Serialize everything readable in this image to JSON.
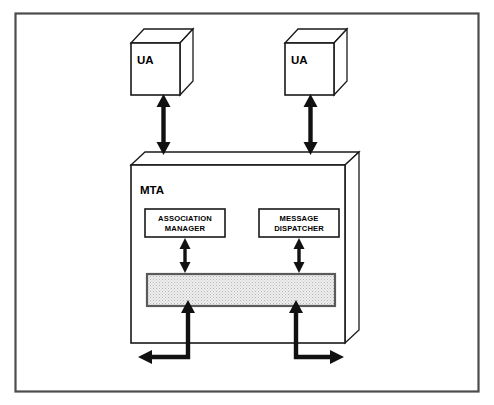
{
  "figure": {
    "type": "block-diagram",
    "title": "",
    "background_color": "#ffffff",
    "frame": {
      "name": "outer-border",
      "color": "#4c4c4c"
    }
  },
  "nodes": {
    "ua_left": {
      "label": "UA",
      "shape": "cube",
      "fill": "#ffffff",
      "stroke": "#1a1a1a"
    },
    "ua_right": {
      "label": "UA",
      "shape": "cube",
      "fill": "#ffffff",
      "stroke": "#1a1a1a"
    },
    "mta": {
      "label": "MTA",
      "shape": "cube",
      "fill": "#ffffff",
      "stroke": "#1a1a1a"
    },
    "association_manager": {
      "label_line1": "ASSOCIATION",
      "label_line2": "MANAGER",
      "shape": "rectangle",
      "fill": "#ffffff"
    },
    "message_dispatcher": {
      "label_line1": "MESSAGE",
      "label_line2": "DISPATCHER",
      "shape": "rectangle",
      "fill": "#ffffff"
    },
    "shared_bar": {
      "label": "",
      "shape": "rectangle",
      "fill": "#e8e8e8",
      "pattern": "stipple"
    }
  },
  "connectors": [
    {
      "name": "ua-left-to-mta",
      "from": "ua_left",
      "to": "mta",
      "style": "double-headed-vertical"
    },
    {
      "name": "ua-right-to-mta",
      "from": "ua_right",
      "to": "mta",
      "style": "double-headed-vertical"
    },
    {
      "name": "association-manager-to-bar",
      "from": "association_manager",
      "to": "shared_bar",
      "style": "double-headed-vertical"
    },
    {
      "name": "message-dispatcher-to-bar",
      "from": "message_dispatcher",
      "to": "shared_bar",
      "style": "double-headed-vertical"
    },
    {
      "name": "bar-to-external-left",
      "from": "shared_bar",
      "to": "external",
      "style": "elbow-double-headed-left"
    },
    {
      "name": "bar-to-external-right",
      "from": "shared_bar",
      "to": "external",
      "style": "elbow-double-headed-right"
    }
  ]
}
